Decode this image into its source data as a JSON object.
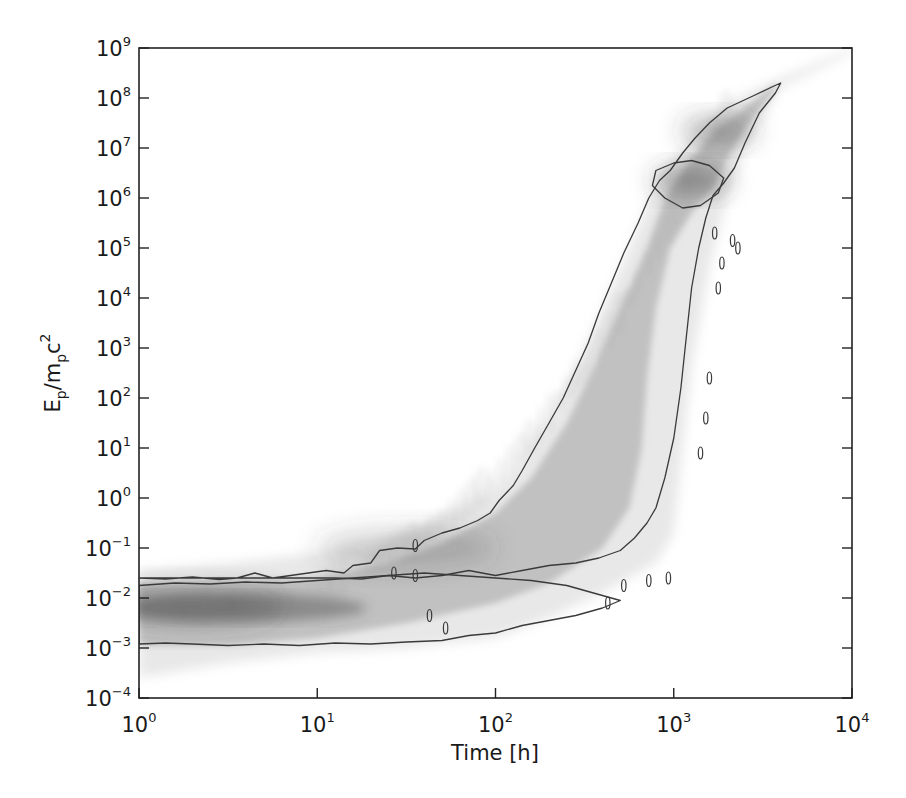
{
  "chart_data": {
    "type": "heatmap",
    "subtype": "2D density histogram with contour lines (grayscale)",
    "title": "",
    "xlabel": "Time [h]",
    "ylabel": "E_p/m_p c^2",
    "ylabel_parts": {
      "E": "E",
      "sub1": "p",
      "slash": "/m",
      "sub2": "p",
      "c": "c",
      "sup": "2"
    },
    "xscale": "log",
    "yscale": "log",
    "xlim": [
      1,
      10000
    ],
    "ylim": [
      0.0001,
      1000000000
    ],
    "grid": false,
    "legend": null,
    "colormap": "grayscale (white = low density, dark gray = high density)",
    "x_ticks": [
      {
        "base": "10",
        "exp": "0",
        "value": 1
      },
      {
        "base": "10",
        "exp": "1",
        "value": 10
      },
      {
        "base": "10",
        "exp": "2",
        "value": 100
      },
      {
        "base": "10",
        "exp": "3",
        "value": 1000
      },
      {
        "base": "10",
        "exp": "4",
        "value": 10000
      }
    ],
    "y_ticks": [
      {
        "base": "10",
        "exp": "−4",
        "value": 0.0001
      },
      {
        "base": "10",
        "exp": "−3",
        "value": 0.001
      },
      {
        "base": "10",
        "exp": "−2",
        "value": 0.01
      },
      {
        "base": "10",
        "exp": "−1",
        "value": 0.1
      },
      {
        "base": "10",
        "exp": "0",
        "value": 1
      },
      {
        "base": "10",
        "exp": "1",
        "value": 10
      },
      {
        "base": "10",
        "exp": "2",
        "value": 100
      },
      {
        "base": "10",
        "exp": "3",
        "value": 1000
      },
      {
        "base": "10",
        "exp": "4",
        "value": 10000
      },
      {
        "base": "10",
        "exp": "5",
        "value": 100000
      },
      {
        "base": "10",
        "exp": "6",
        "value": 1000000
      },
      {
        "base": "10",
        "exp": "7",
        "value": 10000000
      },
      {
        "base": "10",
        "exp": "8",
        "value": 100000000
      },
      {
        "base": "10",
        "exp": "9",
        "value": 1000000000
      }
    ],
    "density_band": {
      "description": "Approximate extent of the faint density region, as log10(time) and log10(E) pairs",
      "upper_edge": [
        [
          0.0,
          -1.45
        ],
        [
          0.5,
          -1.3
        ],
        [
          1.0,
          -1.1
        ],
        [
          1.3,
          -0.9
        ],
        [
          1.6,
          -0.5
        ],
        [
          1.9,
          0.0
        ],
        [
          2.1,
          0.6
        ],
        [
          2.3,
          1.6
        ],
        [
          2.45,
          2.6
        ],
        [
          2.6,
          3.8
        ],
        [
          2.75,
          5.0
        ],
        [
          2.9,
          6.3
        ],
        [
          3.1,
          7.2
        ],
        [
          3.35,
          8.0
        ],
        [
          3.6,
          8.4
        ],
        [
          4.0,
          9.0
        ]
      ],
      "lower_edge": [
        [
          4.0,
          8.9
        ],
        [
          3.6,
          8.2
        ],
        [
          3.4,
          7.0
        ],
        [
          3.3,
          6.0
        ],
        [
          3.2,
          4.6
        ],
        [
          3.1,
          2.6
        ],
        [
          3.05,
          1.0
        ],
        [
          3.0,
          -0.7
        ],
        [
          2.9,
          -1.3
        ],
        [
          2.6,
          -1.9
        ],
        [
          2.3,
          -2.4
        ],
        [
          2.0,
          -2.8
        ],
        [
          1.5,
          -3.0
        ],
        [
          1.0,
          -3.1
        ],
        [
          0.5,
          -3.3
        ],
        [
          0.0,
          -3.6
        ]
      ]
    },
    "dense_core": {
      "description": "Darker core of the distribution",
      "upper_edge": [
        [
          0.0,
          -1.7
        ],
        [
          0.5,
          -1.65
        ],
        [
          1.0,
          -1.6
        ],
        [
          1.4,
          -1.3
        ],
        [
          1.7,
          -0.9
        ],
        [
          2.0,
          -0.3
        ],
        [
          2.2,
          0.4
        ],
        [
          2.4,
          1.5
        ],
        [
          2.55,
          2.6
        ],
        [
          2.7,
          3.8
        ],
        [
          2.85,
          5.0
        ],
        [
          2.95,
          6.0
        ],
        [
          3.1,
          6.8
        ],
        [
          3.25,
          7.4
        ],
        [
          3.45,
          7.95
        ],
        [
          3.58,
          8.3
        ]
      ],
      "lower_edge": [
        [
          3.58,
          8.2
        ],
        [
          3.4,
          7.4
        ],
        [
          3.3,
          6.8
        ],
        [
          3.22,
          6.2
        ],
        [
          3.1,
          5.7
        ],
        [
          2.98,
          5.0
        ],
        [
          2.9,
          3.8
        ],
        [
          2.85,
          2.4
        ],
        [
          2.82,
          1.0
        ],
        [
          2.75,
          -0.2
        ],
        [
          2.6,
          -1.0
        ],
        [
          2.3,
          -1.7
        ],
        [
          2.0,
          -2.1
        ],
        [
          1.5,
          -2.5
        ],
        [
          1.0,
          -2.8
        ],
        [
          0.5,
          -2.95
        ],
        [
          0.0,
          -2.95
        ]
      ]
    },
    "peaks": [
      {
        "label": "initial population",
        "log_t": 0.3,
        "log_E": -2.15,
        "intensity": 0.55
      },
      {
        "label": "intermediate",
        "log_t": 1.5,
        "log_E": -1.0,
        "intensity": 0.35
      },
      {
        "label": "high-energy blob",
        "log_t": 3.1,
        "log_E": 6.35,
        "intensity": 0.8
      },
      {
        "label": "highest-energy tail",
        "log_t": 3.25,
        "log_E": 7.35,
        "intensity": 0.6
      }
    ],
    "contours": [
      {
        "name": "outer contour (main band)",
        "points": [
          [
            0.0,
            -1.6
          ],
          [
            0.15,
            -1.62
          ],
          [
            0.3,
            -1.58
          ],
          [
            0.45,
            -1.63
          ],
          [
            0.55,
            -1.6
          ],
          [
            0.65,
            -1.5
          ],
          [
            0.75,
            -1.6
          ],
          [
            0.85,
            -1.55
          ],
          [
            0.95,
            -1.5
          ],
          [
            1.05,
            -1.45
          ],
          [
            1.15,
            -1.5
          ],
          [
            1.2,
            -1.35
          ],
          [
            1.3,
            -1.3
          ],
          [
            1.35,
            -1.05
          ],
          [
            1.45,
            -1.0
          ],
          [
            1.55,
            -1.02
          ],
          [
            1.6,
            -0.85
          ],
          [
            1.7,
            -0.7
          ],
          [
            1.8,
            -0.6
          ],
          [
            1.9,
            -0.45
          ],
          [
            1.97,
            -0.3
          ],
          [
            2.02,
            -0.05
          ],
          [
            2.1,
            0.25
          ],
          [
            2.15,
            0.55
          ],
          [
            2.22,
            1.0
          ],
          [
            2.3,
            1.5
          ],
          [
            2.38,
            2.0
          ],
          [
            2.45,
            2.55
          ],
          [
            2.52,
            3.1
          ],
          [
            2.58,
            3.7
          ],
          [
            2.65,
            4.3
          ],
          [
            2.72,
            4.9
          ],
          [
            2.8,
            5.5
          ],
          [
            2.86,
            6.0
          ],
          [
            2.92,
            6.35
          ],
          [
            2.98,
            6.55
          ],
          [
            3.05,
            6.9
          ],
          [
            3.12,
            7.2
          ],
          [
            3.2,
            7.5
          ],
          [
            3.3,
            7.8
          ],
          [
            3.45,
            8.05
          ],
          [
            3.55,
            8.22
          ],
          [
            3.6,
            8.3
          ],
          [
            3.57,
            8.1
          ],
          [
            3.48,
            7.7
          ],
          [
            3.4,
            7.1
          ],
          [
            3.34,
            6.6
          ],
          [
            3.28,
            6.3
          ],
          [
            3.22,
            6.05
          ],
          [
            3.18,
            5.6
          ],
          [
            3.14,
            5.0
          ],
          [
            3.1,
            4.2
          ],
          [
            3.07,
            3.2
          ],
          [
            3.04,
            2.2
          ],
          [
            3.0,
            1.2
          ],
          [
            2.95,
            0.4
          ],
          [
            2.9,
            -0.2
          ],
          [
            2.85,
            -0.5
          ],
          [
            2.78,
            -0.8
          ],
          [
            2.7,
            -1.05
          ],
          [
            2.58,
            -1.2
          ],
          [
            2.45,
            -1.3
          ],
          [
            2.3,
            -1.35
          ],
          [
            2.15,
            -1.45
          ],
          [
            2.0,
            -1.55
          ],
          [
            1.85,
            -1.45
          ],
          [
            1.7,
            -1.55
          ],
          [
            1.55,
            -1.6
          ],
          [
            1.4,
            -1.55
          ],
          [
            1.25,
            -1.62
          ],
          [
            1.1,
            -1.6
          ]
        ]
      },
      {
        "name": "inner lower contour (initial population)",
        "points": [
          [
            0.0,
            -1.75
          ],
          [
            0.2,
            -1.7
          ],
          [
            0.4,
            -1.72
          ],
          [
            0.6,
            -1.68
          ],
          [
            0.8,
            -1.7
          ],
          [
            1.0,
            -1.65
          ],
          [
            1.2,
            -1.6
          ],
          [
            1.4,
            -1.55
          ],
          [
            1.6,
            -1.5
          ],
          [
            1.8,
            -1.55
          ],
          [
            2.0,
            -1.6
          ],
          [
            2.2,
            -1.65
          ],
          [
            2.4,
            -1.75
          ],
          [
            2.55,
            -1.9
          ],
          [
            2.7,
            -2.05
          ],
          [
            2.6,
            -2.2
          ],
          [
            2.45,
            -2.35
          ],
          [
            2.3,
            -2.45
          ],
          [
            2.15,
            -2.55
          ],
          [
            2.0,
            -2.7
          ],
          [
            1.85,
            -2.75
          ],
          [
            1.7,
            -2.85
          ],
          [
            1.5,
            -2.88
          ],
          [
            1.3,
            -2.92
          ],
          [
            1.1,
            -2.9
          ],
          [
            0.9,
            -2.95
          ],
          [
            0.7,
            -2.92
          ],
          [
            0.5,
            -2.95
          ],
          [
            0.3,
            -2.92
          ],
          [
            0.15,
            -2.9
          ],
          [
            0.0,
            -2.92
          ]
        ]
      },
      {
        "name": "high-energy blob contour",
        "points": [
          [
            2.9,
            6.55
          ],
          [
            3.0,
            6.7
          ],
          [
            3.1,
            6.75
          ],
          [
            3.2,
            6.65
          ],
          [
            3.28,
            6.4
          ],
          [
            3.25,
            6.1
          ],
          [
            3.15,
            5.85
          ],
          [
            3.05,
            5.8
          ],
          [
            2.95,
            6.0
          ],
          [
            2.88,
            6.25
          ]
        ]
      }
    ],
    "islands": [
      [
        1.43,
        -1.5
      ],
      [
        1.55,
        -1.55
      ],
      [
        1.63,
        -2.35
      ],
      [
        1.72,
        -2.6
      ],
      [
        2.63,
        -2.1
      ],
      [
        2.72,
        -1.75
      ],
      [
        2.86,
        -1.65
      ],
      [
        2.97,
        -1.6
      ],
      [
        3.23,
        5.3
      ],
      [
        3.27,
        4.7
      ],
      [
        3.25,
        4.2
      ],
      [
        3.2,
        2.4
      ],
      [
        3.18,
        1.6
      ],
      [
        3.15,
        0.9
      ],
      [
        3.33,
        5.15
      ],
      [
        3.36,
        5.0
      ],
      [
        1.55,
        -0.95
      ]
    ]
  }
}
